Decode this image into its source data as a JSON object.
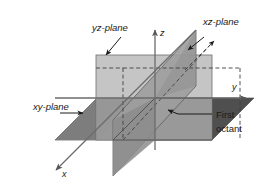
{
  "figure": {
    "background": "#ffffff"
  },
  "labels": {
    "yz_plane": "yz-plane",
    "xz_plane": "xz-plane",
    "xy_plane": "xy-plane",
    "first_octant_line1": "First",
    "first_octant_line2": "octant"
  },
  "axes": [
    {
      "name": "x",
      "label": "x",
      "direction": "down-left",
      "arrow": true
    },
    {
      "name": "y",
      "label": "y",
      "direction": "right",
      "arrow": true
    },
    {
      "name": "z",
      "label": "z",
      "direction": "up",
      "arrow": true
    }
  ],
  "planes": [
    {
      "name": "yz-plane",
      "shape": "rectangle",
      "fill": "#b4b4b4",
      "stroke": "#6e6e6e"
    },
    {
      "name": "xz-plane",
      "shape": "parallelogram",
      "fill": "#9a9a9a",
      "stroke": "#5a5a5a"
    },
    {
      "name": "xy-plane",
      "shape": "parallelogram",
      "fill": "#8a8a8a",
      "stroke": "#5a5a5a"
    }
  ],
  "colors": {
    "plane_light": "#b9b9b9",
    "plane_mid": "#a0a0a0",
    "plane_dark": "#7c7c7c",
    "plane_darkest": "#5e5e5e",
    "axis": "#6b6b6b",
    "text": "#1a1a1a",
    "dashed": "#4d4d4d"
  },
  "origin": {
    "x": 155,
    "y": 98
  }
}
